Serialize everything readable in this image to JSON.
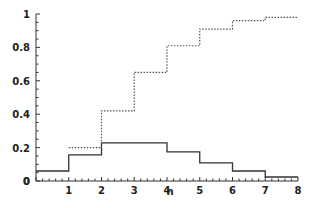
{
  "chart_data": {
    "type": "line",
    "step": true,
    "title": "",
    "xlabel": "n",
    "ylabel": "",
    "xlim": [
      0,
      8
    ],
    "ylim": [
      0,
      1
    ],
    "x_ticks": [
      "0",
      "1",
      "2",
      "3",
      "4",
      "5",
      "6",
      "7",
      "8"
    ],
    "y_ticks": [
      "0",
      "0.2",
      "0.4",
      "0.6",
      "0.8",
      "1"
    ],
    "grid": false,
    "legend": null,
    "series": [
      {
        "name": "pmf",
        "style": "solid",
        "color": "#333333",
        "x": [
          0,
          1,
          2,
          3,
          4,
          5,
          6,
          7
        ],
        "values": [
          0.06,
          0.156,
          0.228,
          0.228,
          0.174,
          0.108,
          0.06,
          0.024
        ]
      },
      {
        "name": "cdf",
        "style": "dotted",
        "color": "#555555",
        "x": [
          1,
          2,
          3,
          4,
          5,
          6,
          7
        ],
        "values": [
          0.2,
          0.42,
          0.65,
          0.81,
          0.91,
          0.96,
          0.98
        ]
      }
    ]
  }
}
